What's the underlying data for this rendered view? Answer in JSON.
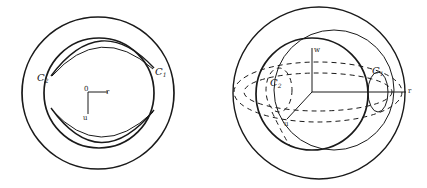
{
  "figures": [
    {
      "id": "left",
      "labels": {
        "c1": "C",
        "c1_sub": "1",
        "c2": "C",
        "c2_sub": "2",
        "origin": "0",
        "r_axis": "r",
        "u_axis": "u"
      }
    },
    {
      "id": "right",
      "labels": {
        "c1": "C",
        "c1_sub": "1",
        "c2": "C",
        "c2_sub": "2",
        "w_axis": "w",
        "r_axis": "r",
        "u_axis": "u"
      }
    }
  ],
  "colors": {
    "line": "#1a1a1a",
    "background": "#ffffff"
  }
}
